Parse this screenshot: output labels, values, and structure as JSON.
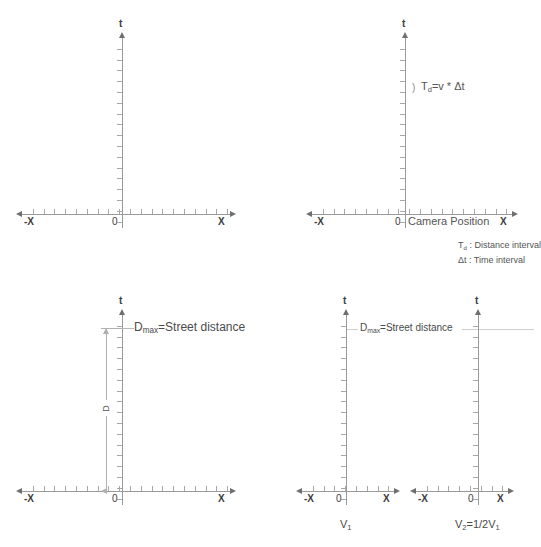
{
  "figure": {
    "axis_labels": {
      "t": "t",
      "x_positive": "X",
      "x_negative": "-X",
      "origin": "0"
    }
  },
  "panels": [
    {
      "id": "panel-1",
      "name": "empty-spacetime-axes",
      "annotations": []
    },
    {
      "id": "panel-2",
      "name": "camera-position-axes",
      "formula": "T<sub>d</sub>=v * Δt",
      "formula_plain": "Td=v * Δt",
      "bracket_marker": ")",
      "x_axis_note": "Camera Position",
      "legend": [
        "T<sub>d</sub> : Distance interval",
        "Δt : Time interval"
      ],
      "legend_plain": [
        "Td : Distance interval",
        "Δt : Time interval"
      ]
    },
    {
      "id": "panel-3",
      "name": "street-distance-axes",
      "dmax_label": "D<sub>max</sub>=Street distance",
      "dmax_label_plain": "Dmax=Street distance",
      "dimension_label": "D"
    },
    {
      "id": "panel-4",
      "name": "velocity-comparison-axes",
      "dmax_label": "D<sub>max</sub>=Street distance",
      "dmax_label_plain": "Dmax=Street distance",
      "subplots": [
        {
          "name": "velocity-1",
          "label": "V<sub>1</sub>",
          "label_plain": "V1"
        },
        {
          "name": "velocity-2",
          "label": "V<sub>2</sub>=1/2V<sub>1</sub>",
          "label_plain": "V2=1/2V1"
        }
      ]
    }
  ],
  "style": {
    "axis_color": "#9a9a9a",
    "tick_color": "#a8a8a8",
    "text_color": "#555555",
    "guide_color": "#cfcfcf",
    "background": "#ffffff"
  }
}
